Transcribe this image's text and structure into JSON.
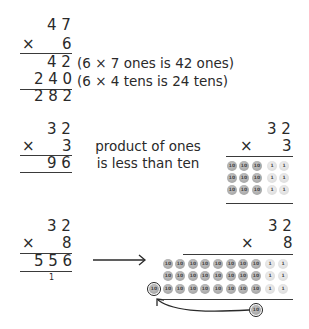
{
  "example1": {
    "multiplicand": "4 7",
    "multiplier_sign": "×",
    "multiplier": "6",
    "partial1": "4 2",
    "partial2": "2 4 0",
    "result": "2 8 2",
    "note1": "(6 × 7 ones is 42 ones)",
    "note2": "(6 × 4 tens is 24 tens)"
  },
  "example2": {
    "multiplicand": "3 2",
    "multiplier_sign": "×",
    "multiplier": "3",
    "result": "9 6",
    "note_line1": "product of ones",
    "note_line2": "is less than ten",
    "model": {
      "multiplicand": "3 2",
      "multiplier_sign": "×",
      "multiplier": "3",
      "rows": 3,
      "tens_per_row": 3,
      "ones_per_row": 2,
      "ten_label": "10",
      "one_label": "1"
    }
  },
  "example3": {
    "multiplicand": "3 2",
    "multiplier_sign": "×",
    "multiplier": "8",
    "result": "5 5 6",
    "carry": "1",
    "model": {
      "multiplicand": "3 2",
      "multiplier_sign": "×",
      "multiplier": "8",
      "rows": 3,
      "tens_per_row": 8,
      "ones_per_row": 2,
      "ten_label": "10",
      "one_label": "1",
      "regrouped_disc_label": "10",
      "new_disc_label": "10"
    }
  },
  "colors": {
    "ink": "#2a2a2a",
    "ten_disc": "#a8a8a8",
    "one_disc": "#e2e2e2"
  }
}
